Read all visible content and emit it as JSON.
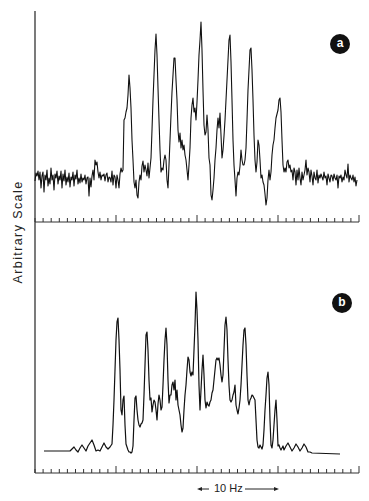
{
  "chart_data": [
    {
      "type": "line",
      "panel": "a",
      "title": "",
      "xlabel": "",
      "ylabel": "Arbitrary Scale",
      "description": "Experimental noisy spectrum (multiplet)",
      "x_units": "Hz",
      "x_range_px": [
        35,
        357
      ],
      "ylim": [
        0,
        100
      ],
      "grid": false,
      "peaks": [
        {
          "x_px": 129,
          "height": 58
        },
        {
          "x_px": 156,
          "height": 88
        },
        {
          "x_px": 177,
          "height": 75
        },
        {
          "x_px": 206,
          "height": 94
        },
        {
          "x_px": 233,
          "height": 87
        },
        {
          "x_px": 253,
          "height": 79
        },
        {
          "x_px": 282,
          "height": 53
        }
      ],
      "baseline_level": 18
    },
    {
      "type": "line",
      "panel": "b",
      "title": "",
      "xlabel": "",
      "ylabel": "Arbitrary Scale",
      "description": "Simulated spectrum (multiplet)",
      "x_units": "Hz",
      "x_range_px": [
        35,
        357
      ],
      "ylim": [
        0,
        100
      ],
      "grid": false,
      "peaks": [
        {
          "x_px": 118,
          "height": 78
        },
        {
          "x_px": 124,
          "height": 42
        },
        {
          "x_px": 146,
          "height": 73
        },
        {
          "x_px": 166,
          "height": 77
        },
        {
          "x_px": 188,
          "height": 65
        },
        {
          "x_px": 196,
          "height": 100
        },
        {
          "x_px": 200,
          "height": 60
        },
        {
          "x_px": 216,
          "height": 58
        },
        {
          "x_px": 224,
          "height": 80
        },
        {
          "x_px": 246,
          "height": 74
        },
        {
          "x_px": 272,
          "height": 67
        },
        {
          "x_px": 283,
          "height": 42
        }
      ],
      "baseline_level": 3
    }
  ],
  "figure": {
    "y_axis_label": "Arbitrary Scale",
    "panels": [
      {
        "id": "a",
        "badge": "a"
      },
      {
        "id": "b",
        "badge": "b"
      }
    ],
    "scale_bar": {
      "label": "10 Hz",
      "from_px": 197,
      "to_px": 278
    },
    "ticks": {
      "spacing_px": 8.1,
      "major_every": 10,
      "start_px": 35,
      "end_px": 359
    },
    "colors": {
      "trace": "#111111",
      "axis": "#333333",
      "badge_bg": "#111111",
      "badge_fg": "#ffffff"
    }
  },
  "traces": {
    "a": "M35,181 L36,173 L37,176 L38,171 L39,180 L40,172 L41,188 L42,176 L43,172 L44,192 L45,175 L46,180 L47,170 L48,186 L49,178 L50,184 L51,168 L52,180 L53,175 L54,190 L55,174 L56,178 L57,171 L58,184 L59,176 L60,180 L61,171 L62,188 L63,174 L64,181 L65,170 L66,185 L67,177 L68,182 L69,173 L70,187 L71,177 L72,180 L73,172 L74,186 L75,175 L76,179 L77,170 L78,184 L79,178 L80,183 L81,174 L82,182 L83,178 L84,180 L85,175 L86,184 L87,178 L88,177 L89,196 L90,178 L91,187 L92,176 L93,170 L94,180 L95,160 L96,165 L97,162 L98,172 L99,178 L100,172 L101,180 L102,175 L103,176 L104,174 L105,181 L106,175 L107,173 L108,182 L109,177 L110,178 L111,182 L112,171 L113,185 L114,175 L115,177 L116,188 L117,175 L118,180 L119,188 L120,174 L121,168 L122,172 L123,170 L124,120 L125,118 L126,112 L127,108 L128,95 L129,75 L130,88 L131,108 L132,140 L133,160 L134,182 L135,188 L136,180 L137,195 L138,198 L139,182 L140,175 L141,180 L142,166 L143,161 L144,172 L145,165 L146,170 L147,176 L148,163 L149,178 L150,168 L151,158 L152,130 L153,100 L154,75 L155,50 L156,34 L157,55 L158,88 L159,120 L160,150 L161,172 L162,168 L163,170 L164,160 L165,155 L166,160 L167,180 L168,188 L169,165 L170,140 L171,115 L172,92 L173,75 L174,58 L175,58 L176,80 L177,100 L178,130 L179,142 L180,133 L181,148 L182,140 L183,150 L184,145 L185,155 L186,160 L187,170 L188,180 L189,165 L190,148 L191,118 L192,105 L193,98 L194,112 L195,108 L196,120 L197,102 L198,80 L199,55 L200,40 L201,22 L202,50 L203,90 L204,125 L205,135 L206,132 L207,115 L208,130 L209,158 L210,165 L211,195 L212,200 L213,190 L214,178 L215,160 L216,148 L217,130 L218,118 L219,128 L220,113 L221,135 L222,158 L223,150 L224,136 L225,120 L226,100 L227,80 L228,60 L229,40 L230,35 L231,62 L232,100 L233,140 L234,165 L235,180 L236,196 L237,178 L238,172 L239,175 L240,166 L241,150 L242,160 L243,165 L244,165 L245,160 L246,148 L247,120 L248,90 L249,70 L250,50 L251,48 L252,70 L253,100 L254,135 L255,160 L256,172 L257,162 L258,140 L259,145 L260,160 L261,178 L262,175 L263,182 L264,185 L265,194 L266,205 L267,198 L268,180 L269,170 L270,180 L271,172 L272,155 L273,145 L274,140 L275,128 L276,118 L277,114 L278,110 L279,100 L280,98 L281,112 L282,140 L283,165 L284,172 L285,168 L286,172 L287,162 L288,160 L289,168 L290,165 L291,172 L292,170 L293,180 L294,168 L295,172 L296,185 L297,170 L298,180 L299,168 L300,178 L301,185 L302,172 L303,180 L304,175 L305,170 L306,160 L307,175 L308,168 L309,172 L310,182 L311,170 L312,176 L313,185 L314,172 L315,178 L316,180 L317,170 L318,183 L319,175 L320,178 L321,174 L322,177 L323,180 L324,172 L325,178 L326,176 L327,185 L328,174 L329,178 L330,182 L331,175 L332,176 L333,181 L334,174 L335,178 L336,180 L337,175 L338,188 L339,176 L340,178 L341,175 L342,182 L343,177 L344,180 L345,170 L346,175 L347,178 L348,164 L349,182 L350,175 L351,178 L352,180 L353,175 L354,182 L355,177 L356,186 L357,180",
    "b": "M44,451 L70,451 L72,449 L74,447 L76,450 L78,452 L80,448 L82,445 L84,448 L86,451 L88,446 L90,443 L92,440 L94,445 L96,451 L98,450 L100,451 L102,447 L104,443 L106,447 L108,449 L110,447 L112,444 L113,425 L114,400 L115,370 L116,340 L117,322 L118,318 L119,340 L120,370 L121,410 L122,415 L123,400 L124,396 L125,425 L126,444 L127,447 L128,450 L129,452 L130,452 L131,453 L132,452 L133,446 L134,420 L135,398 L136,396 L137,410 L138,420 L139,425 L140,427 L141,424 L142,423 L143,420 L144,395 L145,365 L146,335 L147,332 L148,350 L149,380 L150,400 L151,398 L152,412 L153,405 L154,400 L155,402 L156,410 L157,420 L158,404 L159,395 L160,400 L161,410 L162,407 L163,385 L164,360 L165,340 L166,328 L167,345 L168,380 L169,403 L170,395 L171,395 L172,385 L173,382 L174,390 L175,380 L176,400 L177,390 L178,405 L179,410 L180,415 L181,425 L182,432 L183,428 L184,410 L185,395 L186,385 L187,370 L188,357 L189,360 L190,372 L191,376 L192,372 L193,375 L194,350 L195,325 L196,292 L197,310 L198,340 L199,385 L200,410 L201,390 L202,370 L203,355 L204,375 L205,400 L206,408 L207,402 L208,405 L209,406 L210,402 L211,400 L212,393 L213,390 L214,380 L215,370 L216,360 L217,358 L218,360 L219,358 L220,365 L221,375 L222,382 L223,375 L224,350 L225,325 L226,317 L227,330 L228,360 L229,385 L230,400 L231,402 L232,400 L233,395 L234,392 L235,385 L236,405 L237,410 L238,414 L239,408 L240,400 L241,385 L242,365 L243,345 L244,330 L245,328 L246,345 L247,375 L248,400 L249,405 L250,400 L251,398 L252,395 L253,396 L254,398 L255,400 L256,420 L257,440 L258,447 L259,448 L260,445 L261,447 L262,449 L263,445 L264,430 L265,410 L266,395 L267,378 L268,372 L269,385 L270,420 L271,445 L272,448 L273,440 L274,425 L275,410 L276,400 L277,420 L278,446 L279,445 L280,448 L281,450 L282,448 L283,446 L284,450 L286,446 L288,443 L290,447 L292,451 L294,448 L296,444 L298,447 L300,451 L302,448 L304,444 L306,447 L308,452 L310,452 L312,453 L340,454"
  }
}
